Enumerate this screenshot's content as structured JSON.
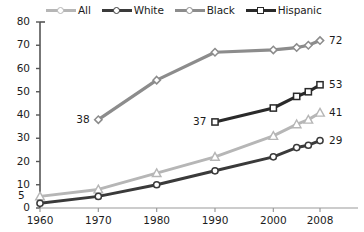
{
  "chart_data": {
    "type": "line",
    "title": "",
    "xlabel": "",
    "ylabel": "",
    "x": [
      1960,
      1970,
      1980,
      1990,
      2000,
      2004,
      2006,
      2008
    ],
    "xlim": [
      1960,
      2008
    ],
    "ylim": [
      0,
      80
    ],
    "ytick_values": [
      0,
      10,
      20,
      30,
      40,
      50,
      60,
      70,
      80
    ],
    "ytick_labels": [
      "0",
      "10",
      "20",
      "30",
      "40",
      "50",
      "60",
      "70",
      "80"
    ],
    "xtick_values": [
      1960,
      1970,
      1980,
      1990,
      2000,
      2008
    ],
    "xtick_labels": [
      "1960",
      "1970",
      "1980",
      "1990",
      "2000",
      "2008"
    ],
    "grid": false,
    "legend_position": "top",
    "series": [
      {
        "name": "All",
        "color": "#b6b6b6",
        "marker": "triangle",
        "x": [
          1960,
          1970,
          1980,
          1990,
          2000,
          2004,
          2006,
          2008
        ],
        "values": [
          5,
          8,
          15,
          22,
          31,
          36,
          38,
          41
        ],
        "point_labels": [
          {
            "x": 1960,
            "value": 5,
            "text": "5"
          },
          {
            "x": 2008,
            "value": 41,
            "text": "41"
          }
        ]
      },
      {
        "name": "White",
        "color": "#3a3a3a",
        "marker": "circle",
        "x": [
          1960,
          1970,
          1980,
          1990,
          2000,
          2004,
          2006,
          2008
        ],
        "values": [
          2,
          5,
          10,
          16,
          22,
          26,
          27,
          29
        ],
        "point_labels": [
          {
            "x": 2008,
            "value": 29,
            "text": "29"
          }
        ]
      },
      {
        "name": "Black",
        "color": "#8c8c8c",
        "marker": "diamond",
        "x": [
          1970,
          1980,
          1990,
          2000,
          2004,
          2006,
          2008
        ],
        "values": [
          38,
          55,
          67,
          68,
          69,
          70,
          72
        ],
        "point_labels": [
          {
            "x": 1970,
            "value": 38,
            "text": "38"
          },
          {
            "x": 2008,
            "value": 72,
            "text": "72"
          }
        ]
      },
      {
        "name": "Hispanic",
        "color": "#2a2a2a",
        "marker": "square",
        "x": [
          1990,
          2000,
          2004,
          2006,
          2008
        ],
        "values": [
          37,
          43,
          48,
          50,
          53
        ],
        "point_labels": [
          {
            "x": 1990,
            "value": 37,
            "text": "37"
          },
          {
            "x": 2008,
            "value": 53,
            "text": "53"
          }
        ]
      }
    ]
  },
  "legend": {
    "items": [
      {
        "label": "All",
        "color": "#b6b6b6",
        "marker": "circle"
      },
      {
        "label": "White",
        "color": "#3a3a3a",
        "marker": "circle"
      },
      {
        "label": "Black",
        "color": "#8c8c8c",
        "marker": "circle"
      },
      {
        "label": "Hispanic",
        "color": "#2a2a2a",
        "marker": "square"
      }
    ]
  },
  "axis": {
    "color": "#555555"
  }
}
